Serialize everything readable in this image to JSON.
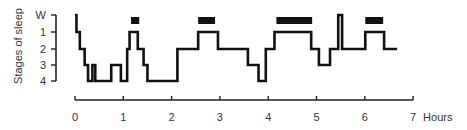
{
  "chart_data": {
    "type": "line",
    "subtype": "step-hypnogram",
    "title": "",
    "xlabel": "Hours",
    "ylabel": "Stages of sleep",
    "xlim": [
      0,
      7
    ],
    "x_ticks": [
      "0",
      "1",
      "2",
      "3",
      "4",
      "5",
      "6",
      "7"
    ],
    "y_ticks": [
      "W",
      "1",
      "2",
      "3",
      "4"
    ],
    "grid": false,
    "legend": null,
    "series": [
      {
        "name": "Sleep stage",
        "step_points_hours_stage": [
          [
            0.0,
            "W"
          ],
          [
            0.03,
            "1"
          ],
          [
            0.1,
            "2"
          ],
          [
            0.2,
            "3"
          ],
          [
            0.27,
            "4"
          ],
          [
            0.36,
            "3"
          ],
          [
            0.42,
            "4"
          ],
          [
            0.75,
            "3"
          ],
          [
            0.95,
            "4"
          ],
          [
            1.08,
            "2"
          ],
          [
            1.13,
            "1"
          ],
          [
            1.3,
            "2"
          ],
          [
            1.42,
            "3"
          ],
          [
            1.5,
            "4"
          ],
          [
            2.12,
            "2"
          ],
          [
            2.55,
            "1"
          ],
          [
            2.96,
            "2"
          ],
          [
            3.58,
            "3"
          ],
          [
            3.8,
            "4"
          ],
          [
            3.95,
            "2"
          ],
          [
            4.13,
            "1"
          ],
          [
            4.89,
            "2"
          ],
          [
            5.05,
            "3"
          ],
          [
            5.28,
            "2"
          ],
          [
            5.45,
            "W"
          ],
          [
            5.53,
            "2"
          ],
          [
            6.01,
            "1"
          ],
          [
            6.4,
            "2"
          ],
          [
            6.67,
            "2"
          ]
        ]
      }
    ],
    "annotations": {
      "rem_bars_hours": [
        [
          1.16,
          1.33
        ],
        [
          2.55,
          2.9
        ],
        [
          4.17,
          4.91
        ],
        [
          6.01,
          6.38
        ]
      ],
      "description": "Black bars above the trace mark REM sleep periods"
    }
  }
}
